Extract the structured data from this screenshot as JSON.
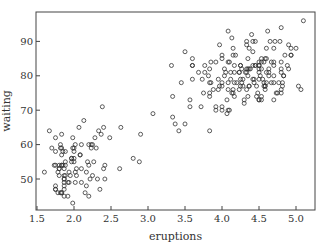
{
  "chart_data": {
    "type": "scatter",
    "title": "",
    "xlabel": "eruptions",
    "ylabel": "waiting",
    "xlim": [
      1.49,
      5.26
    ],
    "ylim": [
      41.0,
      98.6
    ],
    "xticks": [
      1.5,
      2.0,
      2.5,
      3.0,
      3.5,
      4.0,
      4.5,
      5.0
    ],
    "xtick_labels": [
      "1.5",
      "2.0",
      "2.5",
      "3.0",
      "3.5",
      "4.0",
      "4.5",
      "5.0"
    ],
    "yticks": [
      50,
      60,
      70,
      80,
      90
    ],
    "ytick_labels": [
      "50",
      "60",
      "70",
      "80",
      "90"
    ],
    "grid": false,
    "legend": null,
    "marker": "open-circle",
    "marker_color": "#333333",
    "series": [
      {
        "name": "faithful",
        "x": [
          3.6,
          1.8,
          3.333,
          2.283,
          4.533,
          2.883,
          4.7,
          3.6,
          1.95,
          4.35,
          1.833,
          3.917,
          4.2,
          1.75,
          4.7,
          2.167,
          1.75,
          4.8,
          1.6,
          4.25,
          1.8,
          1.75,
          3.45,
          3.067,
          4.533,
          3.6,
          1.967,
          4.083,
          3.85,
          4.433,
          4.3,
          4.467,
          3.367,
          4.033,
          3.833,
          2.017,
          1.867,
          4.833,
          1.833,
          4.783,
          4.35,
          1.883,
          4.567,
          1.75,
          4.533,
          3.317,
          3.833,
          2.1,
          4.633,
          2,
          4.8,
          4.716,
          1.833,
          4.833,
          1.733,
          4.883,
          3.717,
          1.667,
          4.567,
          4.317,
          2.233,
          4.5,
          1.75,
          4.8,
          1.817,
          4.4,
          4.167,
          4.7,
          2.067,
          4.7,
          4.033,
          1.967,
          4.5,
          4,
          1.983,
          5.067,
          2.017,
          4.567,
          3.883,
          3.6,
          4.133,
          4.333,
          4.1,
          2.633,
          4.067,
          4.933,
          3.95,
          4.517,
          2.167,
          4,
          2.2,
          4.333,
          1.867,
          4.817,
          1.833,
          4.3,
          4.667,
          3.75,
          1.867,
          4.9,
          2.483,
          4.367,
          2.1,
          4.5,
          4.05,
          1.867,
          4.7,
          1.783,
          4.85,
          3.683,
          4.733,
          2.3,
          4.9,
          4.417,
          1.7,
          4.633,
          2.317,
          4.6,
          1.817,
          4.417,
          2.617,
          4.067,
          4.25,
          1.967,
          4.6,
          3.767,
          1.917,
          4.5,
          2.267,
          4.65,
          1.867,
          4.167,
          2.8,
          4.333,
          1.833,
          4.383,
          1.883,
          4.933,
          2.033,
          3.733,
          4.233,
          2.233,
          4.533,
          4.817,
          4.333,
          1.983,
          4.633,
          2.017,
          5.1,
          1.8,
          5.033,
          4,
          2.4,
          4.6,
          3.567,
          4,
          4.5,
          4.083,
          1.8,
          3.967,
          2.2,
          4.15,
          2,
          3.833,
          3.5,
          4.583,
          2.367,
          5,
          1.933,
          4.617,
          1.917,
          2.083,
          4.583,
          3.333,
          4.167,
          4.333,
          4.5,
          2.417,
          4,
          4.167,
          1.883,
          4.583,
          4.25,
          3.767,
          2.033,
          4.433,
          4.083,
          1.833,
          4.417,
          2.183,
          4.8,
          1.833,
          4.8,
          4.1,
          3.966,
          4.233,
          3.5,
          4.366,
          2.25,
          4.667,
          2.1,
          4.35,
          4.133,
          1.867,
          4.6,
          1.783,
          4.367,
          3.85,
          1.933,
          4.5,
          2.383,
          4.7,
          1.867,
          3.833,
          3.417,
          4.233,
          2.4,
          4.8,
          2,
          4.15,
          1.867,
          4.267,
          1.75,
          4.483,
          4,
          4.117,
          4.083,
          4.267,
          3.917,
          4.55,
          4.083,
          2.417,
          4.183,
          2.217,
          4.45,
          1.883,
          1.85,
          4.283,
          3.95,
          2.333,
          4.15,
          2.35,
          4.933,
          2.9,
          4.583,
          3.833,
          2.083,
          4.367,
          2.133,
          4.35,
          2.2,
          4.45,
          3.567,
          4.5,
          4.15,
          3.817,
          3.917,
          4.45,
          2,
          4.283,
          4.767,
          4.533,
          1.85,
          4.25,
          1.983,
          2.25,
          4.75,
          4.117,
          2.15,
          4.417,
          1.817,
          4.467
        ],
        "y": [
          79,
          54,
          74,
          62,
          85,
          55,
          88,
          85,
          51,
          85,
          54,
          84,
          78,
          47,
          83,
          52,
          62,
          84,
          52,
          79,
          51,
          47,
          78,
          69,
          74,
          83,
          55,
          76,
          78,
          79,
          73,
          77,
          66,
          80,
          74,
          52,
          48,
          80,
          59,
          90,
          80,
          58,
          84,
          58,
          73,
          83,
          64,
          53,
          82,
          59,
          75,
          90,
          54,
          80,
          54,
          83,
          71,
          64,
          77,
          81,
          59,
          84,
          48,
          82,
          60,
          92,
          78,
          78,
          65,
          73,
          82,
          56,
          79,
          71,
          62,
          76,
          60,
          78,
          76,
          83,
          75,
          82,
          70,
          65,
          73,
          88,
          76,
          80,
          48,
          86,
          60,
          90,
          50,
          78,
          63,
          72,
          84,
          75,
          51,
          82,
          62,
          88,
          49,
          83,
          81,
          47,
          84,
          52,
          86,
          81,
          75,
          59,
          89,
          79,
          59,
          81,
          50,
          85,
          59,
          87,
          53,
          69,
          77,
          56,
          88,
          81,
          45,
          82,
          55,
          90,
          45,
          83,
          56,
          89,
          46,
          82,
          51,
          86,
          53,
          79,
          81,
          60,
          82,
          77,
          76,
          59,
          80,
          49,
          96,
          53,
          77,
          77,
          65,
          81,
          71,
          70,
          81,
          93,
          53,
          89,
          45,
          86,
          58,
          78,
          66,
          76,
          63,
          88,
          52,
          93,
          49,
          57,
          77,
          68,
          81,
          81,
          73,
          50,
          85,
          74,
          55,
          77,
          83,
          83,
          51,
          78,
          84,
          46,
          83,
          55,
          81,
          57,
          76,
          84,
          77,
          81,
          87,
          77,
          51,
          78,
          60,
          82,
          91,
          53,
          78,
          46,
          77,
          84,
          49,
          83,
          71,
          80,
          49,
          75,
          64,
          76,
          53,
          94,
          55,
          76,
          50,
          82,
          54,
          75,
          78,
          79,
          78,
          78,
          70,
          79,
          70,
          54,
          86,
          50,
          90,
          54,
          54,
          77,
          79,
          64,
          75,
          47,
          86,
          63,
          85,
          82,
          57,
          82,
          67,
          74,
          54,
          83,
          73,
          73,
          88,
          80,
          71,
          83,
          56,
          79,
          78,
          84,
          58,
          83,
          43,
          60,
          75,
          81,
          46,
          90,
          46,
          74
        ]
      }
    ]
  }
}
